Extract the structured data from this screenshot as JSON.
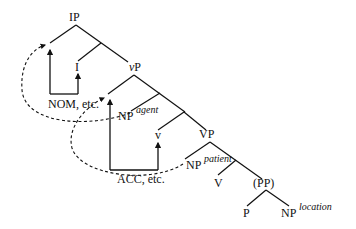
{
  "diagram": {
    "type": "syntax-tree",
    "nodes": {
      "ip": "IP",
      "i": "I",
      "vp_small": "P",
      "vp_small_prefix": "v",
      "np_agent": "NP",
      "np_agent_sup": "agent",
      "v_small": "v",
      "vp": "VP",
      "np_patient": "NP",
      "np_patient_sup": "patient",
      "v_big": "V",
      "pp": "(PP)",
      "p": "P",
      "np_location": "NP",
      "np_location_sup": "location"
    },
    "case_labels": {
      "nom": "NOM, etc.",
      "acc": "ACC, etc."
    }
  }
}
